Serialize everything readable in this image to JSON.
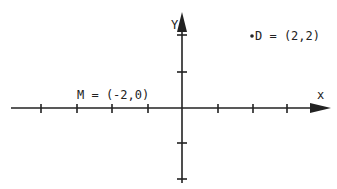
{
  "diagram": {
    "type": "coordinate-plane",
    "axes": {
      "x_label": "x",
      "y_label": "Y",
      "x_ticks": [
        -4,
        -3,
        -2,
        -1,
        1,
        2,
        3
      ],
      "y_ticks": [
        -2,
        -1,
        1,
        2
      ]
    },
    "points": [
      {
        "name": "M",
        "label": "M = (-2,0)",
        "x": -2,
        "y": 0
      },
      {
        "name": "D",
        "label": "D = (2,2)",
        "x": 2,
        "y": 2,
        "marker": "•"
      }
    ],
    "colors": {
      "ink": "#222222",
      "background": "#ffffff"
    }
  }
}
